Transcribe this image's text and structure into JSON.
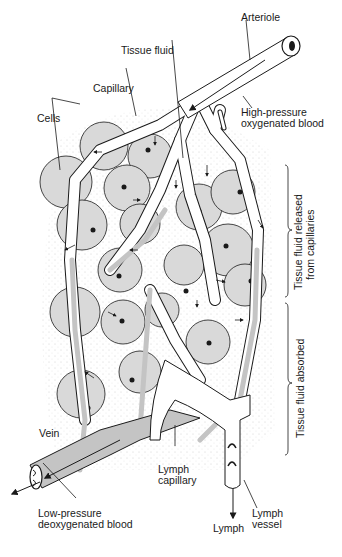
{
  "diagram": {
    "colors": {
      "cell_fill": "#d9d9d9",
      "vessel_blood": "#c4c4c4",
      "lymph_fill": "#ffffff",
      "outline": "#1a1a1a",
      "background": "#ffffff"
    },
    "labels": {
      "arteriole": "Arteriole",
      "tissue_fluid": "Tissue fluid",
      "high_pressure_1": "High-pressure",
      "high_pressure_2": "oxygenated blood",
      "capillary": "Capillary",
      "cells": "Cells",
      "released_1": "Tissue fluid released",
      "released_2": "from capillaries",
      "absorbed": "Tissue fluid absorbed",
      "vein": "Vein",
      "low_pressure_1": "Low-pressure",
      "low_pressure_2": "deoxygenated blood",
      "lymph_capillary_1": "Lymph",
      "lymph_capillary_2": "capillary",
      "lymph_vessel_1": "Lymph",
      "lymph_vessel_2": "vessel",
      "lymph": "Lymph"
    }
  }
}
